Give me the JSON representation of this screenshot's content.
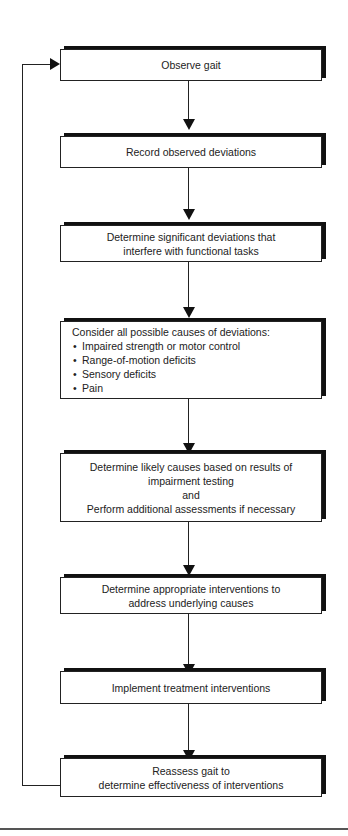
{
  "flowchart": {
    "steps": [
      {
        "text": "Observe gait"
      },
      {
        "text": "Record observed deviations"
      },
      {
        "line1": "Determine significant deviations that",
        "line2": "interfere with functional tasks"
      },
      {
        "heading": "Consider all possible causes of deviations:",
        "bullets": [
          "Impaired strength or motor control",
          "Range-of-motion deficits",
          "Sensory deficits",
          "Pain"
        ]
      },
      {
        "line1": "Determine likely causes based on results of",
        "line2": "impairment testing",
        "line3": "and",
        "line4": "Perform additional assessments if necessary"
      },
      {
        "line1": "Determine appropriate interventions to",
        "line2": "address underlying causes"
      },
      {
        "text": "Implement treatment interventions"
      },
      {
        "line1": "Reassess gait to",
        "line2": "determine effectiveness of interventions"
      }
    ],
    "feedback_loop": {
      "from": "Reassess gait",
      "to": "Observe gait"
    }
  },
  "colors": {
    "line": "#222222",
    "shadow": "#111111",
    "box_fill": "#ffffff"
  }
}
